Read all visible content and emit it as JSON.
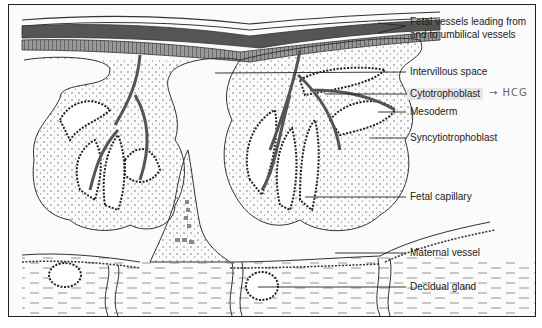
{
  "figure": {
    "labels": [
      {
        "id": "fetal-vessels",
        "lines": [
          "Fetal vessels leading from",
          "and to umbilical vessels"
        ]
      },
      {
        "id": "intervillous-space",
        "text": "Intervillous space"
      },
      {
        "id": "cytotrophoblast",
        "text": "Cytotrophoblast",
        "highlighted": true,
        "annotation": "→ HCG"
      },
      {
        "id": "mesoderm",
        "text": "Mesoderm"
      },
      {
        "id": "syncytiotrophoblast",
        "text": "Syncytiotrophoblast"
      },
      {
        "id": "fetal-capillary",
        "text": "Fetal capillary"
      },
      {
        "id": "maternal-vessel",
        "text": "Maternal vessel"
      },
      {
        "id": "decidual-gland",
        "text": "Decidual gland"
      }
    ]
  },
  "colors": {
    "vessel": "#555555",
    "outline": "#222222",
    "highlight": "#e6e6e6",
    "handwriting": "#666666"
  }
}
